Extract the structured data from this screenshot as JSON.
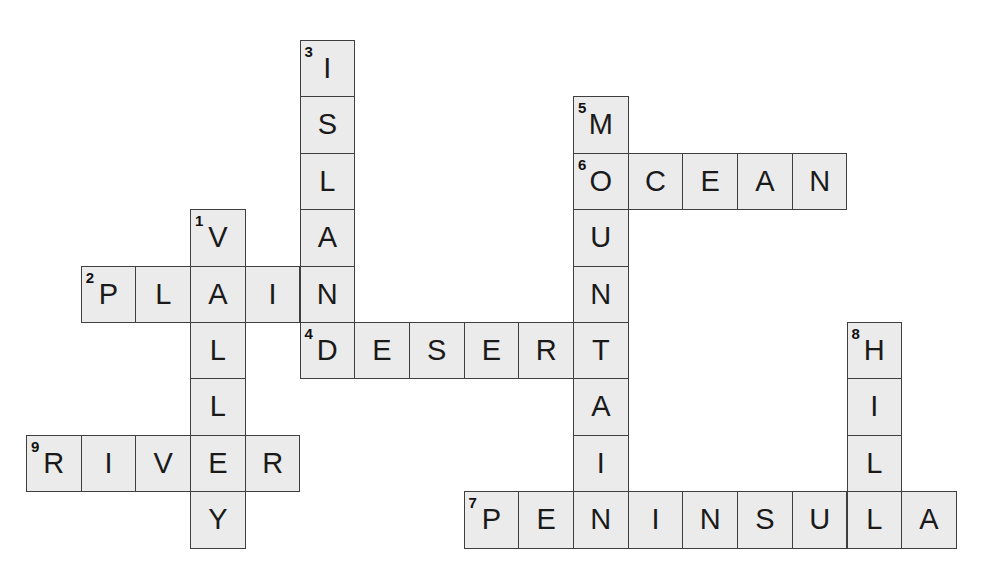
{
  "puzzle": {
    "grid_origin": {
      "x": 26,
      "y": 40
    },
    "cell_size": {
      "w": 54.7,
      "h": 56.4
    },
    "colors": {
      "cell_fill": "#ebebeb",
      "cell_border": "#3f3f3f",
      "text": "#1a1a1a"
    },
    "words": [
      {
        "number": 1,
        "direction": "down",
        "answer": "VALLEY",
        "col": 3,
        "row": 3
      },
      {
        "number": 2,
        "direction": "across",
        "answer": "PLAIN",
        "col": 1,
        "row": 4
      },
      {
        "number": 3,
        "direction": "down",
        "answer": "ISLAND",
        "col": 5,
        "row": 0
      },
      {
        "number": 4,
        "direction": "across",
        "answer": "DESERT",
        "col": 5,
        "row": 5
      },
      {
        "number": 5,
        "direction": "down",
        "answer": "MOUNTAIN",
        "col": 10,
        "row": 1
      },
      {
        "number": 6,
        "direction": "across",
        "answer": "OCEAN",
        "col": 10,
        "row": 2
      },
      {
        "number": 7,
        "direction": "across",
        "answer": "PENINSULA",
        "col": 8,
        "row": 8
      },
      {
        "number": 8,
        "direction": "down",
        "answer": "HILL",
        "col": 15,
        "row": 5
      },
      {
        "number": 9,
        "direction": "across",
        "answer": "RIVER",
        "col": 0,
        "row": 7
      }
    ]
  }
}
